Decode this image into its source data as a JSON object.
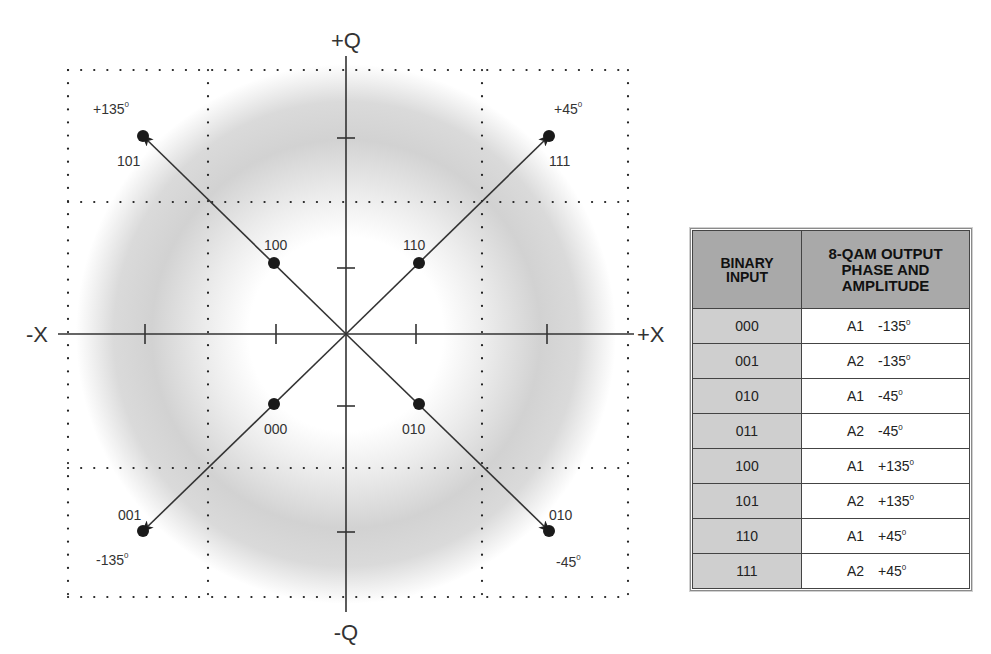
{
  "diagram": {
    "axes": {
      "pos_q": "+Q",
      "neg_q": "-Q",
      "pos_x": "+X",
      "neg_x": "-X"
    },
    "corner_phase_labels": {
      "top_left": "+135",
      "top_right": "+45",
      "bottom_left": "-135",
      "bottom_right": "-45"
    },
    "points": {
      "outer_top_left": "101",
      "outer_top_right": "111",
      "outer_bottom_left": "001",
      "outer_bottom_right": "010",
      "inner_top_left": "100",
      "inner_top_right": "110",
      "inner_bottom_left": "000",
      "inner_bottom_right": "010"
    },
    "degree_symbol": "0"
  },
  "table": {
    "header_input_line1": "BINARY",
    "header_input_line2": "INPUT",
    "header_output_line1": "8-QAM OUTPUT",
    "header_output_line2": "PHASE AND",
    "header_output_line3": "AMPLITUDE",
    "rows": [
      {
        "input": "000",
        "amplitude": "A1",
        "phase": "-135"
      },
      {
        "input": "001",
        "amplitude": "A2",
        "phase": "-135"
      },
      {
        "input": "010",
        "amplitude": "A1",
        "phase": "-45"
      },
      {
        "input": "011",
        "amplitude": "A2",
        "phase": "-45"
      },
      {
        "input": "100",
        "amplitude": "A1",
        "phase": "+135"
      },
      {
        "input": "101",
        "amplitude": "A2",
        "phase": "+135"
      },
      {
        "input": "110",
        "amplitude": "A1",
        "phase": "+45"
      },
      {
        "input": "111",
        "amplitude": "A2",
        "phase": "+45"
      }
    ],
    "degree_symbol": "0"
  },
  "colors": {
    "ink": "#333333",
    "header_bg": "#a9a9a9",
    "input_cell_bg": "#cfcfcf",
    "ring_gray": "#c8c8c8"
  }
}
